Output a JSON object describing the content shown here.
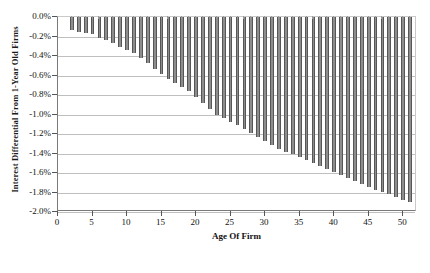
{
  "chart_data": {
    "type": "bar",
    "title": "",
    "subtitle": "",
    "xlabel": "Age Of Firm",
    "ylabel": "Interest Differential From 1-Year Old Firms",
    "xlim": [
      0,
      52
    ],
    "ylim": [
      -2.0,
      0.0
    ],
    "grid": true,
    "legend": null,
    "units": "percent",
    "yticks": [
      0.0,
      -0.2,
      -0.4,
      -0.6,
      -0.8,
      -1.0,
      -1.2,
      -1.4,
      -1.6,
      -1.8,
      -2.0
    ],
    "ytick_labels": [
      "0.0%",
      "-0.2%",
      "-0.4%",
      "-0.6%",
      "-0.8%",
      "-1.0%",
      "-1.2%",
      "-1.4%",
      "-1.6%",
      "-1.8%",
      "-2.0%"
    ],
    "xticks": [
      0,
      5,
      10,
      15,
      20,
      25,
      30,
      35,
      40,
      45,
      50
    ],
    "xtick_labels": [
      "0",
      "5",
      "10",
      "15",
      "20",
      "25",
      "30",
      "35",
      "40",
      "45",
      "50"
    ],
    "bar_color": "#8d8d8d",
    "bar_edge_color": "#565656",
    "categories": [
      2,
      3,
      4,
      5,
      6,
      7,
      8,
      9,
      10,
      11,
      12,
      13,
      14,
      15,
      16,
      17,
      18,
      19,
      20,
      21,
      22,
      23,
      24,
      25,
      26,
      27,
      28,
      29,
      30,
      31,
      32,
      33,
      34,
      35,
      36,
      37,
      38,
      39,
      40,
      41,
      42,
      43,
      44,
      45,
      46,
      47,
      48,
      49,
      50,
      51
    ],
    "values": [
      -0.13,
      -0.15,
      -0.16,
      -0.17,
      -0.22,
      -0.24,
      -0.27,
      -0.31,
      -0.34,
      -0.37,
      -0.42,
      -0.47,
      -0.53,
      -0.58,
      -0.64,
      -0.68,
      -0.72,
      -0.76,
      -0.82,
      -0.88,
      -0.94,
      -1.0,
      -1.04,
      -1.08,
      -1.11,
      -1.15,
      -1.19,
      -1.23,
      -1.27,
      -1.31,
      -1.35,
      -1.38,
      -1.41,
      -1.44,
      -1.47,
      -1.5,
      -1.53,
      -1.56,
      -1.59,
      -1.62,
      -1.65,
      -1.68,
      -1.71,
      -1.74,
      -1.77,
      -1.79,
      -1.82,
      -1.85,
      -1.88,
      -1.9
    ]
  }
}
